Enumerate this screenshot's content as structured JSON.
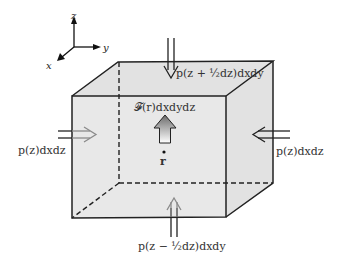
{
  "diagram": {
    "axes": {
      "x_label": "x",
      "y_label": "y",
      "z_label": "z"
    },
    "labels": {
      "top_force": "p(z + ½dz)dxdy",
      "bottom_force": "p(z − ½dz)dxdy",
      "left_force": "p(z)dxdz",
      "right_force": "p(z)dxdz",
      "body_force": "𝓕(r)dxdydz",
      "position": "r"
    },
    "colors": {
      "box_fill": "#e6e6e6",
      "box_edge": "#222222",
      "arrow_outline_dark": "#222222",
      "arrow_outline_gray": "#8a8a8a",
      "body_arrow_top": "#6e6e6e",
      "body_arrow_bottom": "#ffffff"
    }
  }
}
